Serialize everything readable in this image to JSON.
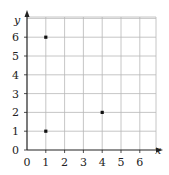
{
  "chart_data": {
    "type": "scatter",
    "title": "",
    "xlabel": "x",
    "ylabel": "y",
    "xlim": [
      0,
      6.5
    ],
    "ylim": [
      0,
      6.5
    ],
    "grid": true,
    "x_ticks": [
      "0",
      "1",
      "2",
      "3",
      "4",
      "5",
      "6"
    ],
    "y_ticks": [
      "0",
      "1",
      "2",
      "3",
      "4",
      "5",
      "6"
    ],
    "points": [
      {
        "x": 1,
        "y": 6
      },
      {
        "x": 1,
        "y": 1
      },
      {
        "x": 4,
        "y": 2
      }
    ],
    "colors": {
      "grid": "#b8b8b8",
      "axis": "#222222",
      "point": "#111111"
    }
  }
}
